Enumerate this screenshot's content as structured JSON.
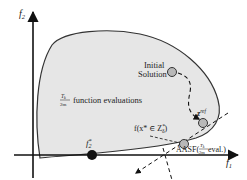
{
  "axes": {
    "y_label": "f",
    "y_label_sub": "2",
    "x_label": "f",
    "x_label_sub": "1"
  },
  "region": {
    "fill": "#e6e6e6",
    "stroke": "#333333",
    "evaluations_frac_num": "T",
    "evaluations_frac_num_sub": "k",
    "evaluations_frac_den": "2m",
    "evaluations_text": "function evaluations"
  },
  "points": {
    "ideal": {
      "label": "f",
      "label_sub": "2",
      "label_sup": "*",
      "color": "#111111"
    },
    "initial": {
      "label_line1": "Initial",
      "label_line2": "Solution",
      "color": "#b8b8b8"
    },
    "zref": {
      "label": "z",
      "label_sup": "ref",
      "color": "#b8b8b8"
    },
    "projected": {
      "label": "f(x* ∈ Z",
      "label_sub": "δ",
      "label_sup": "*",
      "label_end": ")",
      "color": "#b8b8b8"
    }
  },
  "aasf": {
    "label_prefix": "AASF(",
    "frac_num": "T",
    "frac_num_sub": "k",
    "frac_den": "2m",
    "label_suffix": " eval.)"
  }
}
